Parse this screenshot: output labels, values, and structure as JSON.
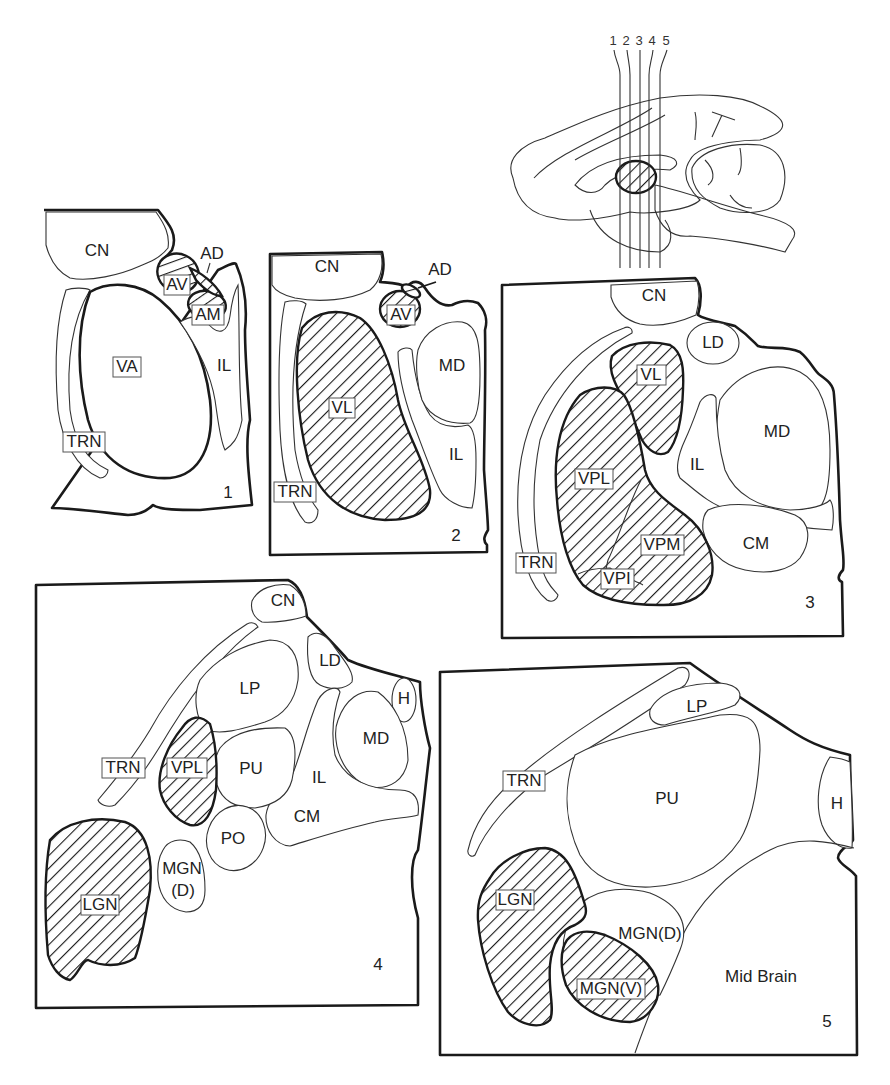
{
  "figure": {
    "sagittal_brain": {
      "section_numbers": [
        "1",
        "2",
        "3",
        "4",
        "5"
      ]
    },
    "panels": [
      {
        "number": "1",
        "regions": {
          "cn": "CN",
          "ad": "AD",
          "av": "AV",
          "am": "AM",
          "va": "VA",
          "il": "IL",
          "trn": "TRN"
        },
        "boxed": [
          "AV",
          "AM",
          "VA",
          "TRN"
        ],
        "hatched": [
          "AV",
          "AM"
        ]
      },
      {
        "number": "2",
        "regions": {
          "cn": "CN",
          "ad": "AD",
          "av": "AV",
          "vl": "VL",
          "md": "MD",
          "il": "IL",
          "trn": "TRN"
        },
        "boxed": [
          "AV",
          "VL",
          "TRN"
        ],
        "hatched": [
          "AV",
          "VL",
          "AD"
        ]
      },
      {
        "number": "3",
        "regions": {
          "cn": "CN",
          "ld": "LD",
          "vl": "VL",
          "md": "MD",
          "il": "IL",
          "vpl": "VPL",
          "vpm": "VPM",
          "vpi": "VPI",
          "cm": "CM",
          "trn": "TRN"
        },
        "boxed": [
          "VL",
          "VPL",
          "VPM",
          "VPI",
          "TRN"
        ],
        "hatched": [
          "VL",
          "VPL",
          "VPM",
          "VPI"
        ]
      },
      {
        "number": "4",
        "regions": {
          "cn": "CN",
          "ld": "LD",
          "lp": "LP",
          "h": "H",
          "md": "MD",
          "trn": "TRN",
          "vpl": "VPL",
          "pu": "PU",
          "il": "IL",
          "cm": "CM",
          "po": "PO",
          "mgn": "MGN",
          "mgn_d": "(D)",
          "lgn": "LGN"
        },
        "boxed": [
          "TRN",
          "VPL",
          "LGN"
        ],
        "hatched": [
          "VPL",
          "LGN"
        ]
      },
      {
        "number": "5",
        "regions": {
          "lp": "LP",
          "trn": "TRN",
          "pu": "PU",
          "h": "H",
          "lgn": "LGN",
          "mgn_d": "MGN(D)",
          "mgn_v": "MGN(V)",
          "mid_brain": "Mid Brain"
        },
        "boxed": [
          "TRN",
          "LGN",
          "MGN(V)"
        ],
        "hatched": [
          "LGN",
          "MGN(V)"
        ]
      }
    ]
  }
}
